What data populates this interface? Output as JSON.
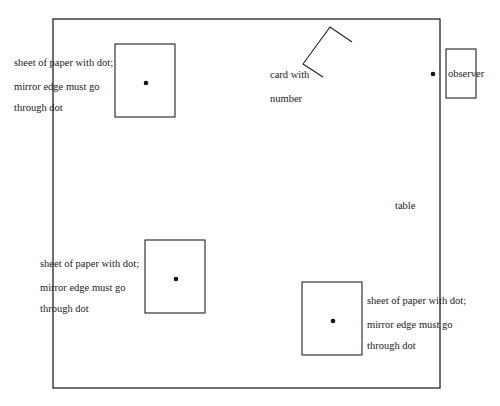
{
  "diagram": {
    "colors": {
      "stroke": "#222222",
      "background": "#ffffff"
    },
    "table": {
      "label": "table",
      "x": 53,
      "y": 19,
      "w": 387,
      "h": 369
    },
    "sheets": [
      {
        "id": "sheet-top-left",
        "x": 115,
        "y": 44,
        "w": 60,
        "h": 73,
        "dot": [
          146,
          83
        ],
        "lines": [
          "sheet of paper with dot;",
          "mirror edge must go",
          "through dot"
        ],
        "label_pos": [
          14,
          56
        ]
      },
      {
        "id": "sheet-bottom-left",
        "x": 145,
        "y": 240,
        "w": 60,
        "h": 73,
        "dot": [
          176,
          279
        ],
        "lines": [
          "sheet of paper with dot;",
          "mirror edge must go",
          "through dot"
        ],
        "label_pos": [
          40,
          257
        ]
      },
      {
        "id": "sheet-bottom-right",
        "x": 302,
        "y": 282,
        "w": 60,
        "h": 73,
        "dot": [
          333,
          321
        ],
        "lines": [
          "sheet of paper with dot;",
          "mirror edge must go",
          "through dot"
        ],
        "label_pos": [
          367,
          294
        ]
      }
    ],
    "card": {
      "lines": [
        "card with",
        "number"
      ],
      "label_pos": [
        270,
        68
      ],
      "points": "352,42 330,27 303,64 323,77"
    },
    "observer": {
      "label": "observer",
      "x": 446,
      "y": 49,
      "w": 30,
      "h": 49,
      "dot": [
        433,
        74
      ]
    }
  }
}
